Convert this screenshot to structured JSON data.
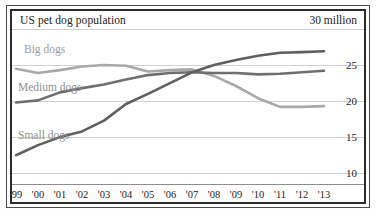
{
  "chart_data": {
    "type": "line",
    "title": "US pet dog population",
    "unit_label": "30 million",
    "xlabel": "",
    "ylabel": "",
    "x": [
      "'99",
      "'00",
      "'01",
      "'02",
      "'03",
      "'04",
      "'05",
      "'06",
      "'07",
      "'08",
      "'09",
      "'10",
      "'11",
      "'12",
      "'13"
    ],
    "ylim": [
      8.5,
      30
    ],
    "yticks": [
      25,
      20,
      15,
      10
    ],
    "grid": true,
    "legend": "inline-labels",
    "series": [
      {
        "name": "Big dogs",
        "color": "#a8a8a8",
        "values": [
          24.5,
          23.9,
          24.3,
          24.8,
          25.0,
          24.9,
          24.1,
          24.3,
          24.4,
          23.5,
          22.1,
          20.4,
          19.2,
          19.2,
          19.3
        ]
      },
      {
        "name": "Medium dogs",
        "color": "#6e6e6e",
        "values": [
          19.8,
          20.1,
          21.2,
          21.8,
          22.3,
          23.0,
          23.6,
          23.9,
          24.0,
          23.9,
          23.9,
          23.7,
          23.8,
          24.0,
          24.2
        ]
      },
      {
        "name": "Small dogs",
        "color": "#5f5f5f",
        "values": [
          12.5,
          13.9,
          15.0,
          15.8,
          17.3,
          19.6,
          21.0,
          22.5,
          24.0,
          25.0,
          25.7,
          26.3,
          26.7,
          26.8,
          26.9
        ]
      }
    ]
  },
  "labels": {
    "big_dogs": "Big dogs",
    "medium_dogs": "Medium dogs",
    "small_dogs": "Small dogs"
  }
}
